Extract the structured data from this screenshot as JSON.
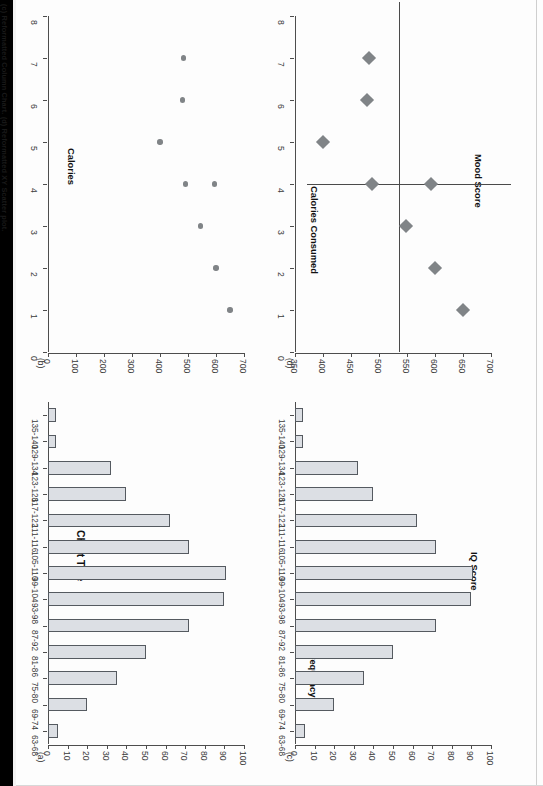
{
  "document": {
    "caption": "(c) Reformatted Column Chart. (d) Reformatted XY Scatter plot."
  },
  "panels": {
    "a": {
      "tag": "(a)",
      "title": "Chart Title",
      "xlabel": "",
      "ylabel": ""
    },
    "b": {
      "tag": "(b)",
      "title": "",
      "xlabel": "",
      "ylabel": "Calories"
    },
    "c": {
      "tag": "(c)",
      "title": "",
      "xlabel": "IQ Score",
      "ylabel": "Frequency"
    },
    "d": {
      "tag": "(d)",
      "title": "",
      "xlabel": "Mood Score",
      "ylabel": "Calories Consumed"
    }
  },
  "chart_data": [
    {
      "id": "a",
      "type": "bar",
      "title": "Chart Title",
      "xlabel": "",
      "ylabel": "",
      "orientation": "vertical",
      "grid": false,
      "ylim": [
        0,
        100
      ],
      "yticks": [
        0,
        10,
        20,
        30,
        40,
        50,
        60,
        70,
        80,
        90,
        100
      ],
      "categories": [
        "63-68",
        "69-74",
        "75-80",
        "81-86",
        "87-92",
        "93-98",
        "99-104",
        "105-110",
        "111-116",
        "117-122",
        "123-128",
        "129-134",
        "135-140"
      ],
      "values": [
        5,
        20,
        35,
        50,
        72,
        90,
        91,
        72,
        62,
        40,
        32,
        4,
        4
      ],
      "bar_fill": "#dcdfe4",
      "bar_stroke": "#555a60"
    },
    {
      "id": "b",
      "type": "scatter",
      "title": "Calories",
      "xlabel": "",
      "ylabel": "Calories",
      "grid": false,
      "xlim": [
        0,
        8
      ],
      "ylim": [
        0,
        700
      ],
      "xticks": [
        0,
        1,
        2,
        3,
        4,
        5,
        6,
        7,
        8
      ],
      "yticks": [
        0,
        100,
        200,
        300,
        400,
        500,
        600,
        700
      ],
      "points": [
        {
          "x": 1,
          "y": 650
        },
        {
          "x": 2,
          "y": 600
        },
        {
          "x": 3,
          "y": 545
        },
        {
          "x": 4,
          "y": 595
        },
        {
          "x": 4,
          "y": 490
        },
        {
          "x": 5,
          "y": 400
        },
        {
          "x": 6,
          "y": 480
        },
        {
          "x": 7,
          "y": 485
        }
      ],
      "marker": "circle",
      "marker_color": "#808487"
    },
    {
      "id": "c",
      "type": "bar",
      "title": "",
      "xlabel": "IQ Score",
      "ylabel": "Frequency",
      "orientation": "vertical",
      "grid": false,
      "ylim": [
        0,
        100
      ],
      "yticks": [
        0,
        10,
        20,
        30,
        40,
        50,
        60,
        70,
        80,
        90,
        100
      ],
      "categories": [
        "63-68",
        "69-74",
        "75-80",
        "81-86",
        "87-92",
        "93-98",
        "99-104",
        "105-110",
        "111-116",
        "117-122",
        "123-128",
        "129-134",
        "135-140"
      ],
      "values": [
        5,
        20,
        35,
        50,
        72,
        90,
        91,
        72,
        62,
        40,
        32,
        4,
        4
      ],
      "bar_fill": "#dcdfe4",
      "bar_stroke": "#555a60"
    },
    {
      "id": "d",
      "type": "scatter",
      "title": "",
      "xlabel": "Mood Score",
      "ylabel": "Calories Consumed",
      "grid": false,
      "xlim": [
        0,
        8
      ],
      "ylim": [
        350,
        700
      ],
      "xticks": [
        0,
        1,
        2,
        3,
        4,
        5,
        6,
        7,
        8
      ],
      "yticks": [
        350,
        400,
        450,
        500,
        550,
        600,
        650,
        700
      ],
      "points": [
        {
          "x": 1,
          "y": 650
        },
        {
          "x": 2,
          "y": 600
        },
        {
          "x": 3,
          "y": 548
        },
        {
          "x": 4,
          "y": 592
        },
        {
          "x": 4,
          "y": 487
        },
        {
          "x": 5,
          "y": 400
        },
        {
          "x": 6,
          "y": 478
        },
        {
          "x": 7,
          "y": 482
        }
      ],
      "marker": "diamond",
      "marker_color": "#808487",
      "reference_lines": {
        "x": 4,
        "y": 535,
        "color": "#4a4a4a"
      }
    }
  ]
}
